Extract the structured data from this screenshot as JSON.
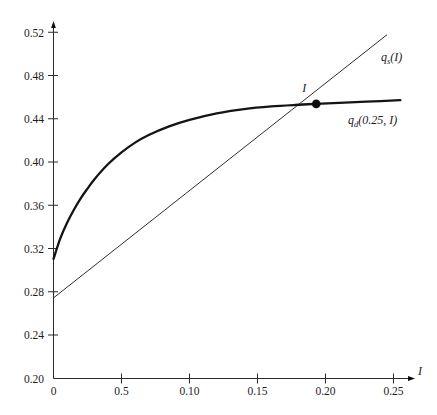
{
  "chart_data": {
    "type": "line",
    "title": "",
    "subtitle": "",
    "xlabel": "I",
    "ylabel": "",
    "xlim": [
      0.0,
      0.262
    ],
    "ylim": [
      0.2,
      0.528
    ],
    "grid": false,
    "legend_position": "inline-right",
    "x_ticks": [
      {
        "value": 0.0,
        "label": "0"
      },
      {
        "value": 0.05,
        "label": "0.5"
      },
      {
        "value": 0.1,
        "label": "0.10"
      },
      {
        "value": 0.15,
        "label": "0.15"
      },
      {
        "value": 0.2,
        "label": "0.20"
      },
      {
        "value": 0.25,
        "label": "0.25"
      }
    ],
    "y_ticks": [
      {
        "value": 0.2,
        "label": "0.20"
      },
      {
        "value": 0.24,
        "label": "0.24"
      },
      {
        "value": 0.28,
        "label": "0.28"
      },
      {
        "value": 0.32,
        "label": "0.32"
      },
      {
        "value": 0.36,
        "label": "0.36"
      },
      {
        "value": 0.4,
        "label": "0.40"
      },
      {
        "value": 0.44,
        "label": "0.44"
      },
      {
        "value": 0.48,
        "label": "0.48"
      },
      {
        "value": 0.52,
        "label": "0.52"
      }
    ],
    "series": [
      {
        "name": "q_d(0.25, I)",
        "label_main": "q",
        "label_sub": "d",
        "label_tail": "(0.25, I)",
        "style": "thick-concave-curve",
        "color": "#141414",
        "x": [
          0.0,
          0.005,
          0.01,
          0.015,
          0.02,
          0.025,
          0.03,
          0.04,
          0.05,
          0.06,
          0.07,
          0.085,
          0.1,
          0.12,
          0.14,
          0.16,
          0.18,
          0.193,
          0.21,
          0.23,
          0.255
        ],
        "y": [
          0.3105,
          0.3295,
          0.344,
          0.356,
          0.3665,
          0.3755,
          0.384,
          0.398,
          0.409,
          0.418,
          0.425,
          0.433,
          0.439,
          0.445,
          0.449,
          0.4515,
          0.453,
          0.4538,
          0.4548,
          0.4558,
          0.4572
        ]
      },
      {
        "name": "q_s(I)",
        "label_main": "q",
        "label_sub": "s",
        "label_tail": "(I)",
        "style": "thin-straight-line",
        "color": "#2e2e2e",
        "x": [
          0.0,
          0.245
        ],
        "y": [
          0.2745,
          0.5175
        ]
      }
    ],
    "annotations": [
      {
        "name": "equilibrium-point",
        "label": "I",
        "x": 0.1932,
        "y": 0.4538,
        "marker": "filled-circle"
      }
    ]
  },
  "axis": {
    "x_name": "I",
    "y_name": ""
  }
}
